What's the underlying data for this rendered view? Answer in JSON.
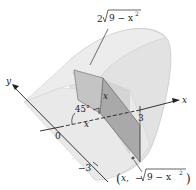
{
  "diagram": {
    "axes": {
      "x_label": "x",
      "y_label": "y"
    },
    "ticks": {
      "origin": "0",
      "x_tick": "3",
      "y_tick": "−3"
    },
    "labels": {
      "top_length_coef": "2",
      "top_length_rad": "9 − x",
      "top_length_exp": "2",
      "angle": "45°",
      "height": "x",
      "base_x": "x",
      "point_open": "(",
      "point_x": "x,",
      "point_minus": "−",
      "point_rad": "9 − x",
      "point_exp": "2",
      "point_close": ")"
    },
    "colors": {
      "solid_light": "#e6e6e6",
      "solid_mid": "#d4d4d4",
      "solid_dark": "#b8b8b8",
      "cross_section": "#a9a9a9",
      "line": "#333333"
    }
  }
}
